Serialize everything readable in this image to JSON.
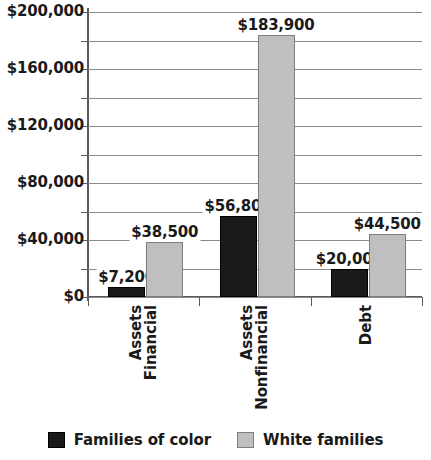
{
  "chart_data": {
    "type": "bar",
    "title": "",
    "xlabel": "",
    "ylabel": "",
    "ylim": [
      0,
      200000
    ],
    "ytick_step": 40000,
    "gridline_step": 20000,
    "grid": true,
    "legend_position": "bottom",
    "categories": [
      "Financial Assets",
      "Nonfinancial Assets",
      "Debt"
    ],
    "category_lines": [
      [
        "Financial",
        "Assets"
      ],
      [
        "Nonfinancial",
        "Assets"
      ],
      [
        "Debt"
      ]
    ],
    "ytick_labels": [
      "$200,000",
      "$160,000",
      "$120,000",
      "$80,000",
      "$40,000",
      "$0"
    ],
    "ytick_values": [
      200000,
      160000,
      120000,
      80000,
      40000,
      0
    ],
    "series": [
      {
        "name": "Families of color",
        "color": "#1a1a1a",
        "values": [
          7200,
          56800,
          20000
        ],
        "labels": [
          "$7,200",
          "$56,800",
          "$20,000"
        ]
      },
      {
        "name": "White families",
        "color": "#bfbfbf",
        "values": [
          38500,
          183900,
          44500
        ],
        "labels": [
          "$38,500",
          "$183,900",
          "$44,500"
        ]
      }
    ]
  },
  "legend": {
    "items": [
      {
        "label": "Families of color",
        "swatch": "dark"
      },
      {
        "label": "White families",
        "swatch": "light"
      }
    ]
  }
}
